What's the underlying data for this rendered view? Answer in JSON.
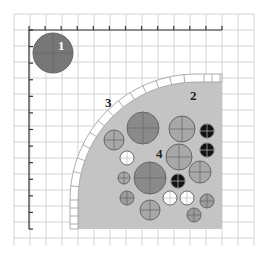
{
  "diagram": {
    "type": "spatial-region-diagram",
    "labels": {
      "region1": "1",
      "region2": "2",
      "region3": "3",
      "region4": "4"
    },
    "colors": {
      "grid": "#d4d4d4",
      "axis": "#333333",
      "region_fill": "#c4c4c4",
      "region1_fill": "#777777",
      "dark_circle": "#8a8a8a",
      "medium_circle": "#a8a8a8",
      "white_circle": "#ffffff",
      "black_circle": "#111111",
      "stipple_circle": "#9c9c9c"
    },
    "grid": {
      "x0": 14,
      "y0": 14,
      "x1": 254,
      "y1": 246,
      "step": 16
    },
    "axes": {
      "x_axis": {
        "y": 30,
        "from": 29,
        "to": 222,
        "ticks": 12
      },
      "y_axis": {
        "x": 29,
        "from": 30,
        "to": 229,
        "ticks": 13
      }
    },
    "circles": [
      {
        "id": "c1",
        "cx": 53,
        "cy": 53,
        "r": 20,
        "kind": "region1"
      },
      {
        "id": "c2",
        "cx": 143,
        "cy": 128,
        "r": 16,
        "kind": "dark"
      },
      {
        "id": "c3",
        "cx": 114,
        "cy": 140,
        "r": 10,
        "kind": "medium"
      },
      {
        "id": "c4",
        "cx": 182,
        "cy": 129,
        "r": 13,
        "kind": "medium"
      },
      {
        "id": "c5",
        "cx": 207,
        "cy": 131,
        "r": 7,
        "kind": "black"
      },
      {
        "id": "c6",
        "cx": 207,
        "cy": 150,
        "r": 7,
        "kind": "black"
      },
      {
        "id": "c7",
        "cx": 127,
        "cy": 158,
        "r": 7,
        "kind": "white"
      },
      {
        "id": "c8",
        "cx": 179,
        "cy": 157,
        "r": 13,
        "kind": "medium"
      },
      {
        "id": "c9",
        "cx": 200,
        "cy": 172,
        "r": 11,
        "kind": "medium"
      },
      {
        "id": "c10",
        "cx": 150,
        "cy": 178,
        "r": 16,
        "kind": "dark"
      },
      {
        "id": "c11",
        "cx": 124,
        "cy": 178,
        "r": 6,
        "kind": "medium"
      },
      {
        "id": "c12",
        "cx": 178,
        "cy": 181,
        "r": 7,
        "kind": "black"
      },
      {
        "id": "c13",
        "cx": 127,
        "cy": 198,
        "r": 7,
        "kind": "stipple"
      },
      {
        "id": "c14",
        "cx": 170,
        "cy": 198,
        "r": 7,
        "kind": "white"
      },
      {
        "id": "c15",
        "cx": 187,
        "cy": 198,
        "r": 7,
        "kind": "white"
      },
      {
        "id": "c16",
        "cx": 207,
        "cy": 201,
        "r": 7,
        "kind": "stipple"
      },
      {
        "id": "c17",
        "cx": 150,
        "cy": 210,
        "r": 10,
        "kind": "medium"
      },
      {
        "id": "c18",
        "cx": 194,
        "cy": 215,
        "r": 7,
        "kind": "stipple"
      }
    ]
  }
}
